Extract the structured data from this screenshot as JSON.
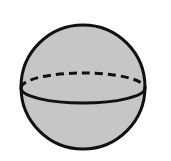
{
  "diagram": {
    "colors": {
      "background": "#ffffff",
      "fill": "#c6c6c6",
      "stroke": "#111111"
    },
    "sphere": {
      "cx": 83,
      "cy": 87,
      "r": 62,
      "stroke_width": 3
    },
    "equator": {
      "cx": 83,
      "cy": 88,
      "rx": 62,
      "ry": 15,
      "back_style": "dashed",
      "front_style": "solid",
      "dash": "8 5"
    }
  }
}
